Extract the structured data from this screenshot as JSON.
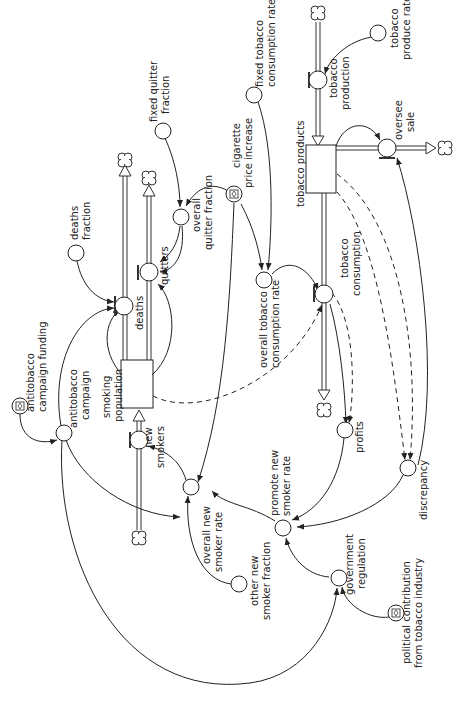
{
  "diagram": {
    "type": "stock-and-flow",
    "orientation": "rotated-90",
    "stocks": {
      "smoking_population": [
        "smoking",
        "population"
      ],
      "tobacco_products": [
        "tobacco products"
      ]
    },
    "flows": {
      "deaths": [
        "deaths"
      ],
      "quitters": [
        "quitters"
      ],
      "new_smokers": [
        "new",
        "smokers"
      ],
      "tobacco_production": [
        "tobacco",
        "production"
      ],
      "oversee_sale": [
        "oversee",
        "sale"
      ],
      "tobacco_consumption": [
        "tobacco",
        "consumption"
      ]
    },
    "auxiliaries": {
      "deaths_fraction": [
        "deaths",
        "fraction"
      ],
      "fixed_quitter_fraction": [
        "fixed quitter",
        "fraction"
      ],
      "overall_quitter_fraction": [
        "overall",
        "quitter fraction"
      ],
      "cigarette_price_increase": [
        "cigarette",
        "price increase"
      ],
      "fixed_tobacco_consumption_rate": [
        "fixed tobacco",
        "consumption rate"
      ],
      "tobacco_produce_rate": [
        "tobacco",
        "produce rate"
      ],
      "overall_tobacco_consumption_rate": [
        "overall tobacco",
        "consumption rate"
      ],
      "antitobacco_campaign_funding": [
        "antitobacco",
        "campaign funding"
      ],
      "antitobacco_campaign": [
        "antitobacco",
        "campaign"
      ],
      "overall_new_smoker_rate": [
        "overall new",
        "smoker rate"
      ],
      "other_new_smoker_fraction": [
        "other new",
        "smoker fraction"
      ],
      "promote_new_smoker_rate": [
        "promote new",
        "smoker rate"
      ],
      "profits": [
        "profits"
      ],
      "discrepancy": [
        "discrepancy"
      ],
      "government_regulation": [
        "government",
        "regulation"
      ],
      "political_contribution": [
        "political contribution",
        "from tobacco industry"
      ]
    },
    "colors": {
      "line": "#222222",
      "background": "#ffffff"
    }
  }
}
